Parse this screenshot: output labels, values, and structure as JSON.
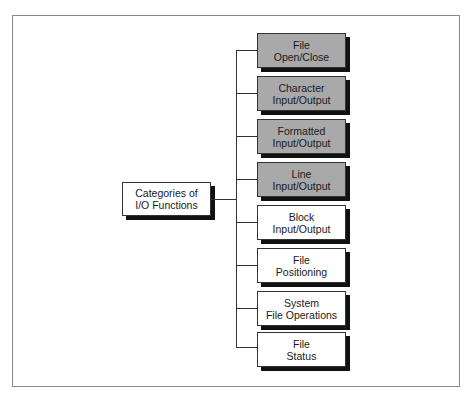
{
  "diagram": {
    "type": "tree",
    "root": {
      "lines": [
        "Categories of",
        "I/O Functions"
      ]
    },
    "children": [
      {
        "lines": [
          "File",
          "Open/Close"
        ],
        "shaded": true
      },
      {
        "lines": [
          "Character",
          "Input/Output"
        ],
        "shaded": true
      },
      {
        "lines": [
          "Formatted",
          "Input/Output"
        ],
        "shaded": true
      },
      {
        "lines": [
          "Line",
          "Input/Output"
        ],
        "shaded": true
      },
      {
        "lines": [
          "Block",
          "Input/Output"
        ],
        "shaded": false
      },
      {
        "lines": [
          "File",
          "Positioning"
        ],
        "shaded": false
      },
      {
        "lines": [
          "System",
          "File Operations"
        ],
        "shaded": false
      },
      {
        "lines": [
          "File",
          "Status"
        ],
        "shaded": false
      }
    ],
    "colors": {
      "shaded_fill": "#a9a9a9",
      "plain_fill": "#ffffff",
      "line": "#333333",
      "shadow": "#111111"
    }
  }
}
